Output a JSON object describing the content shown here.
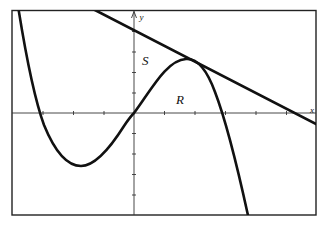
{
  "figure": {
    "type": "function-graph",
    "axis_labels": {
      "x": "x",
      "y": "y"
    },
    "region_labels": {
      "S": "S",
      "R": "R"
    },
    "colors": {
      "stroke": "#111111",
      "axis": "#333333",
      "frame": "#222222",
      "background": "#ffffff"
    },
    "elements": [
      {
        "name": "cubic-curve",
        "description": "cubic through origin with local min in quadrant III and local max in quadrant I"
      },
      {
        "name": "tangent-line",
        "description": "line tangent to the curve near its local maximum, negative slope, crossing the positive x-axis"
      },
      {
        "name": "region-S",
        "description": "region bounded by the y-axis, the tangent line, and the curve"
      },
      {
        "name": "region-R",
        "description": "region bounded by the curve and the x-axis in quadrant I"
      }
    ]
  }
}
